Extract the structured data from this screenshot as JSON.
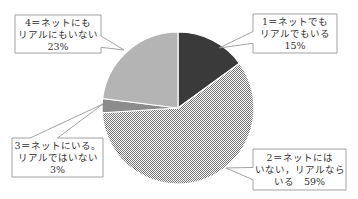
{
  "chart_data": {
    "type": "pie",
    "title": "",
    "start_angle_deg": 0,
    "direction": "clockwise",
    "categories": [
      "1＝ネットでもリアルでもいる",
      "2＝ネットにはいない，リアルならいる",
      "3＝ネットにいる。リアルではいない",
      "4＝ネットにもリアルにもいない"
    ],
    "values": [
      15,
      59,
      3,
      23
    ],
    "unit": "%",
    "legend": "none",
    "data_labels": [
      {
        "lines": [
          "1＝ネットでも",
          "リアルでもいる",
          "15%"
        ]
      },
      {
        "lines": [
          "2＝ネットには",
          "いない，リアルなら",
          "いる　59%"
        ]
      },
      {
        "lines": [
          "3＝ネットにいる。",
          "リアルではいない",
          "3%"
        ]
      },
      {
        "lines": [
          "4＝ネットにも",
          "リアルにもいない",
          "23%"
        ]
      }
    ],
    "slice_styles": [
      {
        "fill": "#3a3a3a",
        "pattern": "solid"
      },
      {
        "fill": "#9a9a9a",
        "pattern": "checker"
      },
      {
        "fill": "#8c8c8c",
        "pattern": "solid"
      },
      {
        "fill": "#b4b4b4",
        "pattern": "solid"
      }
    ],
    "callouts": [
      {
        "box": [
          253,
          14,
          84,
          39
        ],
        "anchor": [
          219,
          48
        ]
      },
      {
        "box": [
          253,
          149,
          93,
          41
        ],
        "anchor": [
          226,
          168
        ]
      },
      {
        "box": [
          12,
          138,
          91,
          39
        ],
        "anchor": [
          103,
          104
        ]
      },
      {
        "box": [
          15,
          15,
          86,
          38
        ],
        "anchor": [
          124,
          50
        ]
      }
    ],
    "geometry": {
      "cx": 178,
      "cy": 108,
      "r": 76
    }
  }
}
